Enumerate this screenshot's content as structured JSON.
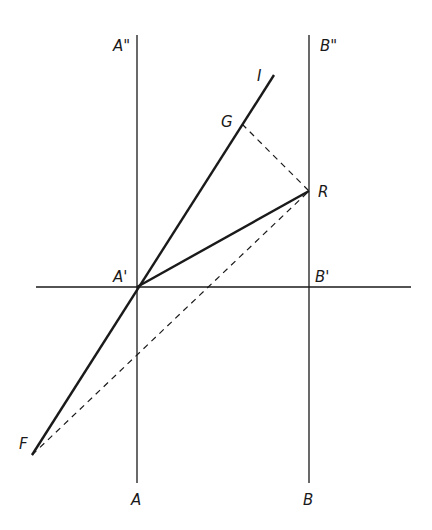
{
  "diagram": {
    "type": "geometric-construction",
    "colors": {
      "stroke": "#1a1a1a",
      "background": "#ffffff"
    },
    "labels": {
      "A_top": "A\"",
      "B_top": "B\"",
      "I": "I",
      "G": "G",
      "R": "R",
      "A_prime": "A'",
      "B_prime": "B'",
      "F": "F",
      "A": "A",
      "B": "B"
    },
    "points": {
      "A_prime": [
        137,
        287
      ],
      "B_prime": [
        309,
        287
      ],
      "R": [
        309,
        191
      ],
      "G": [
        242,
        124
      ],
      "I": [
        274,
        75
      ],
      "F": [
        32,
        455
      ]
    },
    "lines": [
      {
        "name": "line-AA",
        "from": "A",
        "to": "A\"",
        "style": "solid-thin"
      },
      {
        "name": "line-BB",
        "from": "B",
        "to": "B\"",
        "style": "solid-thin"
      },
      {
        "name": "horizontal-axis",
        "through": [
          "A'",
          "B'"
        ],
        "style": "solid-thin"
      },
      {
        "name": "line-FI",
        "from": "F",
        "to": "I",
        "through": "A'",
        "style": "solid-thick"
      },
      {
        "name": "segment-AR",
        "from": "A'",
        "to": "R",
        "style": "solid-thick"
      },
      {
        "name": "segment-GR",
        "from": "G",
        "to": "R",
        "style": "dashed"
      },
      {
        "name": "segment-FR",
        "from": "F",
        "to": "R",
        "style": "dashed"
      }
    ]
  }
}
